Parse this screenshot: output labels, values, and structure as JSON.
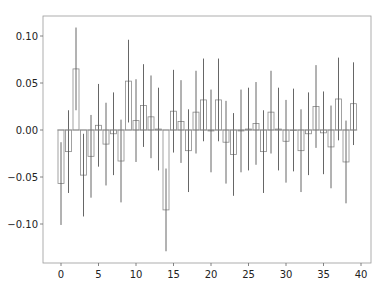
{
  "chart_data": {
    "type": "bar",
    "title": "",
    "xlabel": "",
    "ylabel": "",
    "categories": [
      0,
      1,
      2,
      3,
      4,
      5,
      6,
      7,
      8,
      9,
      10,
      11,
      12,
      13,
      14,
      15,
      16,
      17,
      18,
      19,
      20,
      21,
      22,
      23,
      24,
      25,
      26,
      27,
      28,
      29,
      30,
      31,
      32,
      33,
      34,
      35,
      36,
      37,
      38,
      39
    ],
    "values": [
      -0.057,
      -0.023,
      0.065,
      -0.048,
      -0.028,
      0.005,
      -0.015,
      -0.004,
      -0.033,
      0.052,
      0.01,
      0.026,
      0.014,
      0.001,
      -0.085,
      0.02,
      0.009,
      -0.022,
      0.019,
      0.032,
      -0.001,
      0.032,
      -0.013,
      -0.026,
      -0.001,
      0.001,
      0.007,
      -0.023,
      0.019,
      0.001,
      -0.012,
      0.0,
      -0.022,
      -0.004,
      0.025,
      -0.003,
      -0.018,
      0.033,
      -0.034,
      0.028
    ],
    "error": 0.044,
    "xlim": [
      -2,
      41.7
    ],
    "ylim": [
      -0.142,
      0.121
    ],
    "xticks": [
      0,
      5,
      10,
      15,
      20,
      25,
      30,
      35,
      40
    ],
    "yticks": [
      0.1,
      0.05,
      0.0,
      -0.05,
      -0.1
    ],
    "ytick_labels": [
      "0.10",
      "0.05",
      "0.00",
      "−0.05",
      "−0.10"
    ],
    "grid": false,
    "legend": null,
    "colors": {
      "bar_fill": "#ffffff",
      "bar_edge": "#8a8a8a",
      "error_line": "#555555",
      "axes": "#999999"
    }
  }
}
